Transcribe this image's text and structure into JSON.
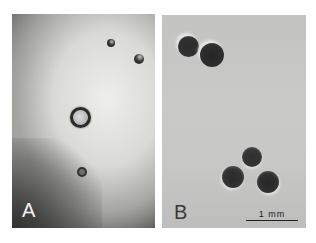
{
  "figure": {
    "panels": [
      {
        "label": "A",
        "description": "Light micrograph of small, sparse colonies on dark vignetted background",
        "colonies": [
          {
            "x": 99,
            "y": 29,
            "d": 8,
            "type": "dark-small"
          },
          {
            "x": 127,
            "y": 45,
            "d": 9,
            "type": "dark-small"
          },
          {
            "x": 68,
            "y": 103,
            "d": 18,
            "type": "ringed-light-center"
          },
          {
            "x": 70,
            "y": 158,
            "d": 9,
            "type": "dark-small"
          }
        ]
      },
      {
        "label": "B",
        "description": "Light micrograph of larger dark colonies on uniform grey background",
        "colonies": [
          {
            "x": 26,
            "y": 31,
            "d": 20,
            "type": "dark-large"
          },
          {
            "x": 50,
            "y": 40,
            "d": 23,
            "type": "dark-large"
          },
          {
            "x": 90,
            "y": 142,
            "d": 19,
            "type": "dark-large"
          },
          {
            "x": 71,
            "y": 162,
            "d": 21,
            "type": "dark-large"
          },
          {
            "x": 106,
            "y": 167,
            "d": 21,
            "type": "dark-large"
          }
        ]
      }
    ],
    "scale_bar": {
      "label": "1 mm"
    }
  }
}
